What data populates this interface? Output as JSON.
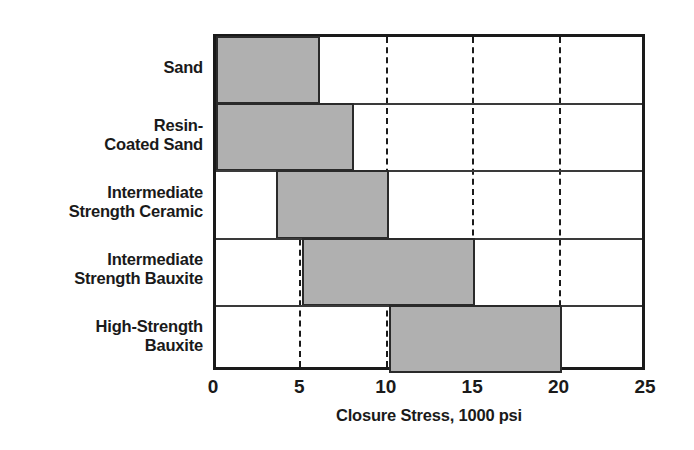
{
  "chart_data": {
    "type": "bar",
    "orientation": "horizontal",
    "subtype": "range-bar",
    "title": "",
    "xlabel": "Closure Stress, 1000 psi",
    "ylabel": "",
    "xlim": [
      0,
      25
    ],
    "xticks": [
      0,
      5,
      10,
      15,
      20,
      25
    ],
    "xtick_labels": [
      "0",
      "5",
      "10",
      "15",
      "20",
      "25"
    ],
    "grid": true,
    "grid_axis": "x",
    "grid_style": "dashed",
    "legend": false,
    "categories": [
      "Sand",
      "Resin-Coated Sand",
      "Intermediate Strength Ceramic",
      "Intermediate Strength Bauxite",
      "High-Strength Bauxite"
    ],
    "bars": [
      {
        "category": "Sand",
        "label_lines": [
          "Sand"
        ],
        "start": 0,
        "end": 6
      },
      {
        "category": "Resin-Coated Sand",
        "label_lines": [
          "Resin-",
          "Coated Sand"
        ],
        "start": 0,
        "end": 8
      },
      {
        "category": "Intermediate Strength Ceramic",
        "label_lines": [
          "Intermediate",
          "Strength Ceramic"
        ],
        "start": 3.5,
        "end": 10
      },
      {
        "category": "Intermediate Strength Bauxite",
        "label_lines": [
          "Intermediate",
          "Strength Bauxite"
        ],
        "start": 5,
        "end": 15
      },
      {
        "category": "High-Strength Bauxite",
        "label_lines": [
          "High-Strength",
          "Bauxite"
        ],
        "start": 10,
        "end": 20
      }
    ],
    "colors": {
      "bar_fill": "#b0b0b0",
      "bar_edge": "#2a2a2a",
      "axis": "#1a1a1a",
      "gridline": "#1a1a1a",
      "background": "#ffffff",
      "text": "#1a1a1a"
    }
  }
}
